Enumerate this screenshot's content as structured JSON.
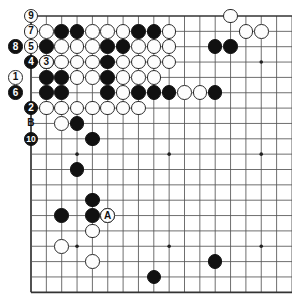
{
  "diagram": {
    "type": "go-board-diagram",
    "board_size": 19,
    "visible_region": {
      "cols": 18,
      "rows": 18
    },
    "geometry": {
      "origin_x": 31,
      "origin_y": 16,
      "spacing": 15.35,
      "stone_radius": 7.3
    },
    "colors": {
      "black": "#111111",
      "white": "#fdfdfd",
      "line": "#555555",
      "edge": "#333333",
      "background": "#ffffff"
    },
    "star_points": [
      [
        3,
        3
      ],
      [
        3,
        9
      ],
      [
        3,
        15
      ],
      [
        9,
        3
      ],
      [
        9,
        9
      ],
      [
        9,
        15
      ],
      [
        15,
        3
      ],
      [
        15,
        9
      ],
      [
        15,
        15
      ]
    ],
    "black_stones": [
      [
        2,
        1
      ],
      [
        3,
        1
      ],
      [
        7,
        1
      ],
      [
        8,
        1
      ],
      [
        1,
        2
      ],
      [
        5,
        2
      ],
      [
        6,
        2
      ],
      [
        12,
        2
      ],
      [
        13,
        2
      ],
      [
        1,
        3
      ],
      [
        5,
        3
      ],
      [
        1,
        4
      ],
      [
        2,
        4
      ],
      [
        5,
        4
      ],
      [
        1,
        5
      ],
      [
        2,
        5
      ],
      [
        5,
        5
      ],
      [
        7,
        5
      ],
      [
        8,
        5
      ],
      [
        9,
        5
      ],
      [
        12,
        5
      ],
      [
        3,
        7
      ],
      [
        4,
        8
      ],
      [
        3,
        10
      ],
      [
        4,
        12
      ],
      [
        4,
        13
      ],
      [
        2,
        13
      ],
      [
        12,
        16
      ],
      [
        8,
        17
      ]
    ],
    "white_stones": [
      [
        1,
        1
      ],
      [
        4,
        1
      ],
      [
        5,
        1
      ],
      [
        6,
        1
      ],
      [
        9,
        1
      ],
      [
        14,
        1
      ],
      [
        2,
        2
      ],
      [
        3,
        2
      ],
      [
        4,
        2
      ],
      [
        7,
        2
      ],
      [
        8,
        2
      ],
      [
        9,
        2
      ],
      [
        2,
        3
      ],
      [
        3,
        3
      ],
      [
        4,
        3
      ],
      [
        6,
        3
      ],
      [
        7,
        3
      ],
      [
        8,
        3
      ],
      [
        9,
        3
      ],
      [
        3,
        4
      ],
      [
        4,
        4
      ],
      [
        6,
        4
      ],
      [
        7,
        4
      ],
      [
        8,
        4
      ],
      [
        6,
        5
      ],
      [
        10,
        5
      ],
      [
        11,
        5
      ],
      [
        1,
        6
      ],
      [
        2,
        6
      ],
      [
        3,
        6
      ],
      [
        4,
        6
      ],
      [
        5,
        6
      ],
      [
        6,
        6
      ],
      [
        7,
        6
      ],
      [
        2,
        7
      ],
      [
        5,
        13
      ],
      [
        4,
        14
      ],
      [
        2,
        15
      ],
      [
        4,
        16
      ],
      [
        15,
        1
      ],
      [
        13,
        0
      ]
    ],
    "numbered_stones": [
      {
        "label": "9",
        "col": 0,
        "row": 0,
        "color": "white"
      },
      {
        "label": "7",
        "col": 0,
        "row": 1,
        "color": "white"
      },
      {
        "label": "5",
        "col": 0,
        "row": 2,
        "color": "white"
      },
      {
        "label": "8",
        "col": -1,
        "row": 2,
        "color": "black"
      },
      {
        "label": "4",
        "col": 0,
        "row": 3,
        "color": "black"
      },
      {
        "label": "3",
        "col": 1,
        "row": 3,
        "color": "white"
      },
      {
        "label": "1",
        "col": -1,
        "row": 4,
        "color": "white"
      },
      {
        "label": "6",
        "col": -1,
        "row": 5,
        "color": "black"
      },
      {
        "label": "2",
        "col": 0,
        "row": 6,
        "color": "black"
      },
      {
        "label": "B",
        "col": 0,
        "row": 7,
        "color": "plain"
      },
      {
        "label": "10",
        "col": 0,
        "row": 8,
        "color": "black"
      }
    ],
    "letter_markers": [
      {
        "label": "A",
        "col": 5,
        "row": 13
      }
    ]
  }
}
